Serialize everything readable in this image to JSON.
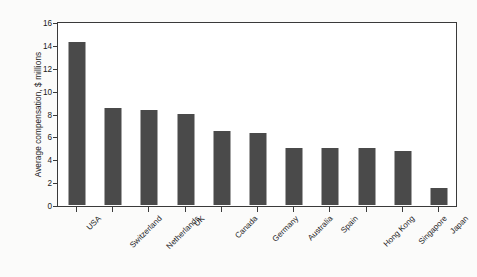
{
  "chart_data": {
    "type": "bar",
    "title": "",
    "subtitle": "",
    "xlabel": "",
    "ylabel": "Average compensation, $ millions",
    "ylim": [
      0,
      16
    ],
    "yticks": [
      0,
      2,
      4,
      6,
      8,
      10,
      12,
      14,
      16
    ],
    "grid": false,
    "legend": false,
    "bar_color": "#4a4a4a",
    "frame_color": "#3a3a3a",
    "plot_background": "#ffffff",
    "figure_background": "#fbfbfa",
    "xtick_rotation": -45,
    "categories": [
      "USA",
      "Switzerland",
      "Netherlands",
      "UK",
      "Canada",
      "Germany",
      "Australia",
      "Spain",
      "Hong Kong",
      "Singapore",
      "Japan"
    ],
    "values": [
      14.25,
      8.5,
      8.3,
      8.0,
      6.5,
      6.3,
      5.0,
      5.0,
      5.0,
      4.7,
      1.5
    ]
  }
}
